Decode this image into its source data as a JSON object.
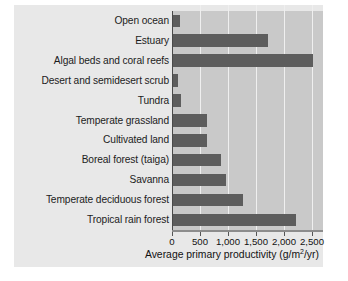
{
  "chart_data": {
    "type": "bar",
    "orientation": "horizontal",
    "title": "",
    "xlabel": "Average primary productivity (g/m2/yr)",
    "ylabel": "",
    "xlim": [
      0,
      2500
    ],
    "grid": true,
    "legend": "none",
    "tick_labels": [
      "0",
      "500",
      "1,000",
      "1,500",
      "2,000",
      "2,500"
    ],
    "ticks": [
      0,
      500,
      1000,
      1500,
      2000,
      2500
    ],
    "categories": [
      "Open ocean",
      "Estuary",
      "Algal beds and coral reefs",
      "Desert and semidesert scrub",
      "Tundra",
      "Temperate grassland",
      "Cultivated land",
      "Boreal forest (taiga)",
      "Savanna",
      "Temperate deciduous forest",
      "Tropical rain forest"
    ],
    "values": [
      125,
      1700,
      2500,
      90,
      140,
      600,
      600,
      850,
      950,
      1250,
      2200
    ],
    "bar_color": "#5d5d5d",
    "panel_color": "#c9c9c9",
    "background_color": "#e8e8e8",
    "gridline_color": "#efefef"
  },
  "axis": {
    "title_prefix": "Average primary productivity (g/m",
    "title_exponent": "2",
    "title_suffix": "/yr)"
  }
}
